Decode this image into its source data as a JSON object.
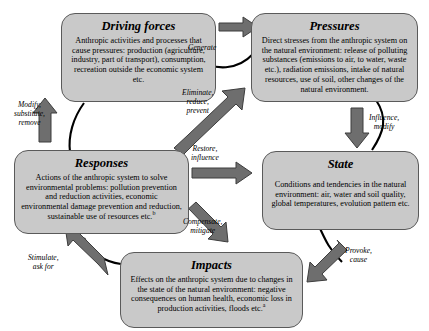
{
  "diagram": {
    "colors": {
      "node_fill": "#c9c9c9",
      "node_border": "#5a5a5a",
      "arrow_fill": "#6e6e6e",
      "arrow_border": "#3d3d3d",
      "connector": "#000000",
      "background": "#ffffff"
    },
    "nodes": [
      {
        "id": "driving_forces",
        "title": "Driving forces",
        "body": "Anthropic activities and processes that cause pressures: production (agriculture, industry, part of transport), consumption, recreation outside the economic system etc."
      },
      {
        "id": "pressures",
        "title": "Pressures",
        "body": "Direct stresses from the anthropic system on the natural environment: release of polluting substances (emissions to air, to water, waste etc.), radiation emissions, intake of natural resources, use of soil, other changes of the natural environment."
      },
      {
        "id": "responses",
        "title": "Responses",
        "body": "Actions of the anthropic system to solve environmental problems: pollution prevention and reduction activities, economic environmental damage prevention and reduction, sustainable use of resources etc.",
        "footnote_marker": "b"
      },
      {
        "id": "state",
        "title": "State",
        "body": "Conditions and tendencies in the natural environment: air, water and soil quality, global temperatures, evolution pattern etc."
      },
      {
        "id": "impacts",
        "title": "Impacts",
        "body": "Effects on the anthropic system due to changes in the state of the natural environment: negative consequences on human health, economic loss in production activities, floods etc.",
        "footnote_marker": "a"
      }
    ],
    "edges": [
      {
        "id": "generate",
        "label": "Generate",
        "from": "driving_forces",
        "to": "pressures"
      },
      {
        "id": "eliminate",
        "label": "Eliminate,\nreduce,\nprevent",
        "from": "responses",
        "to": "pressures"
      },
      {
        "id": "modify",
        "label": "Modify,\nsubstitute,\nremove",
        "from": "responses",
        "to": "driving_forces"
      },
      {
        "id": "influence",
        "label": "Influence,\nmodify",
        "from": "pressures",
        "to": "state"
      },
      {
        "id": "restore",
        "label": "Restore,\ninfluence",
        "from": "responses",
        "to": "state"
      },
      {
        "id": "compensate",
        "label": "Compensate,\nmitigate",
        "from": "responses",
        "to": "impacts"
      },
      {
        "id": "stimulate",
        "label": "Stimulate,\nask for",
        "from": "impacts",
        "to": "responses"
      },
      {
        "id": "provoke",
        "label": "Provoke,\ncause",
        "from": "state",
        "to": "impacts"
      }
    ],
    "edge_labels": {
      "generate": "Generate",
      "eliminate_l1": "Eliminate,",
      "eliminate_l2": "reduce,",
      "eliminate_l3": "prevent",
      "modify_l1": "Modify,",
      "modify_l2": "substitute,",
      "modify_l3": "remove",
      "influence_l1": "Influence,",
      "influence_l2": "modify",
      "restore_l1": "Restore,",
      "restore_l2": "influence",
      "compensate_l1": "Compensate,",
      "compensate_l2": "mitigate",
      "stimulate_l1": "Stimulate,",
      "stimulate_l2": "ask for",
      "provoke_l1": "Provoke,",
      "provoke_l2": "cause"
    }
  }
}
